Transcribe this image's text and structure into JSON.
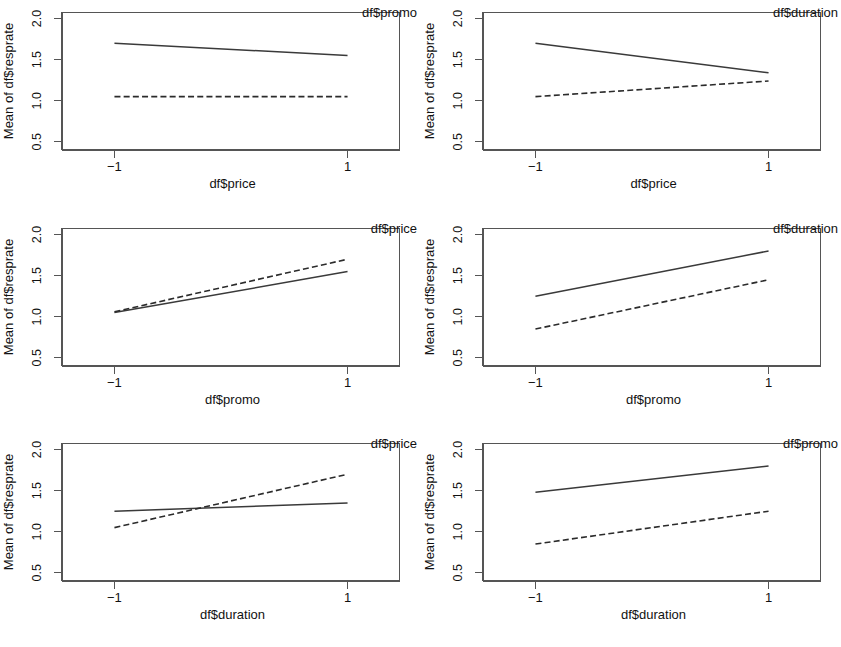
{
  "figure": {
    "type": "interaction-plot-grid",
    "rows": 3,
    "cols": 2,
    "panel_count": 6,
    "y_axis_title": "Mean of df$resprate",
    "y_ticks": [
      "0.5",
      "1.0",
      "1.5",
      "2.0"
    ],
    "y_tick_values": [
      0.5,
      1.0,
      1.5,
      2.0
    ],
    "x_ticks": [
      "−1",
      "1"
    ],
    "x_tick_values": [
      -1,
      1
    ],
    "ylim": [
      0.4,
      2.08
    ],
    "xlim": [
      -1.45,
      1.45
    ],
    "line_color": "#3a3a3a",
    "box_color": "#555555",
    "background": "#ffffff"
  },
  "chart_data": [
    {
      "type": "line",
      "title": "",
      "xlabel": "df$price",
      "ylabel": "Mean of df$resprate",
      "trace_label": "df$promo",
      "x": [
        -1,
        1
      ],
      "xlim": [
        -1.45,
        1.45
      ],
      "ylim": [
        0.4,
        2.08
      ],
      "xticks": [
        -1,
        1
      ],
      "yticks": [
        0.5,
        1.0,
        1.5,
        2.0
      ],
      "grid": false,
      "legend_position": "top-right",
      "series": [
        {
          "name": "solid",
          "style": "solid",
          "values": [
            1.7,
            1.55
          ]
        },
        {
          "name": "dashed",
          "style": "dashed",
          "values": [
            1.05,
            1.05
          ]
        }
      ]
    },
    {
      "type": "line",
      "title": "",
      "xlabel": "df$price",
      "ylabel": "Mean of df$resprate",
      "trace_label": "df$duration",
      "x": [
        -1,
        1
      ],
      "xlim": [
        -1.45,
        1.45
      ],
      "ylim": [
        0.4,
        2.08
      ],
      "xticks": [
        -1,
        1
      ],
      "yticks": [
        0.5,
        1.0,
        1.5,
        2.0
      ],
      "grid": false,
      "legend_position": "top-right",
      "series": [
        {
          "name": "solid",
          "style": "solid",
          "values": [
            1.7,
            1.34
          ]
        },
        {
          "name": "dashed",
          "style": "dashed",
          "values": [
            1.05,
            1.24
          ]
        }
      ]
    },
    {
      "type": "line",
      "title": "",
      "xlabel": "df$promo",
      "ylabel": "Mean of df$resprate",
      "trace_label": "df$price",
      "x": [
        -1,
        1
      ],
      "xlim": [
        -1.45,
        1.45
      ],
      "ylim": [
        0.4,
        2.08
      ],
      "xticks": [
        -1,
        1
      ],
      "yticks": [
        0.5,
        1.0,
        1.5,
        2.0
      ],
      "grid": false,
      "legend_position": "top-right",
      "series": [
        {
          "name": "solid",
          "style": "solid",
          "values": [
            1.05,
            1.55
          ]
        },
        {
          "name": "dashed",
          "style": "dashed",
          "values": [
            1.06,
            1.7
          ]
        }
      ]
    },
    {
      "type": "line",
      "title": "",
      "xlabel": "df$promo",
      "ylabel": "Mean of df$resprate",
      "trace_label": "df$duration",
      "x": [
        -1,
        1
      ],
      "xlim": [
        -1.45,
        1.45
      ],
      "ylim": [
        0.4,
        2.08
      ],
      "xticks": [
        -1,
        1
      ],
      "yticks": [
        0.5,
        1.0,
        1.5,
        2.0
      ],
      "grid": false,
      "legend_position": "top-right",
      "series": [
        {
          "name": "solid",
          "style": "solid",
          "values": [
            1.25,
            1.8
          ]
        },
        {
          "name": "dashed",
          "style": "dashed",
          "values": [
            0.85,
            1.45
          ]
        }
      ]
    },
    {
      "type": "line",
      "title": "",
      "xlabel": "df$duration",
      "ylabel": "Mean of df$resprate",
      "trace_label": "df$price",
      "x": [
        -1,
        1
      ],
      "xlim": [
        -1.45,
        1.45
      ],
      "ylim": [
        0.4,
        2.08
      ],
      "xticks": [
        -1,
        1
      ],
      "yticks": [
        0.5,
        1.0,
        1.5,
        2.0
      ],
      "grid": false,
      "legend_position": "top-right",
      "series": [
        {
          "name": "solid",
          "style": "solid",
          "values": [
            1.25,
            1.35
          ]
        },
        {
          "name": "dashed",
          "style": "dashed",
          "values": [
            1.05,
            1.7
          ]
        }
      ]
    },
    {
      "type": "line",
      "title": "",
      "xlabel": "df$duration",
      "ylabel": "Mean of df$resprate",
      "trace_label": "df$promo",
      "x": [
        -1,
        1
      ],
      "xlim": [
        -1.45,
        1.45
      ],
      "ylim": [
        0.4,
        2.08
      ],
      "xticks": [
        -1,
        1
      ],
      "yticks": [
        0.5,
        1.0,
        1.5,
        2.0
      ],
      "grid": false,
      "legend_position": "top-right",
      "series": [
        {
          "name": "solid",
          "style": "solid",
          "values": [
            1.48,
            1.8
          ]
        },
        {
          "name": "dashed",
          "style": "dashed",
          "values": [
            0.85,
            1.25
          ]
        }
      ]
    }
  ]
}
